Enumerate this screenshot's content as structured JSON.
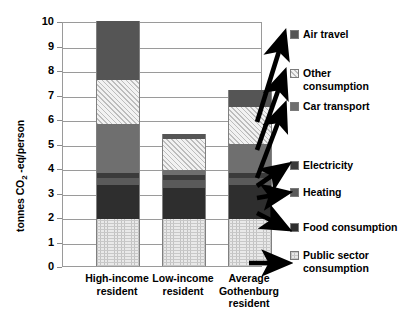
{
  "chart_data": {
    "type": "bar",
    "subtype": "stacked",
    "title": "",
    "xlabel": "",
    "ylabel": "tonnes CO₂ -eq/person",
    "ylim": [
      0,
      10
    ],
    "yticks": [
      0,
      1,
      2,
      3,
      4,
      5,
      6,
      7,
      8,
      9,
      10
    ],
    "ytick_labels": [
      "0",
      "1",
      "2",
      "3",
      "4",
      "5",
      "6",
      "7",
      "8",
      "9",
      "10"
    ],
    "grid": true,
    "grid_axis": "y",
    "legend_position": "right",
    "categories": [
      "High-income resident",
      "Low-income resident",
      "Average Gothenburg resident"
    ],
    "category_lines": [
      [
        "High-income",
        "resident"
      ],
      [
        "Low-income",
        "resident"
      ],
      [
        "Average",
        "Gothenburg",
        "resident"
      ]
    ],
    "series": [
      {
        "name": "Public sector consumption",
        "key": "public",
        "color": "#e9e9e9",
        "pattern": "dotted-grid",
        "values": [
          1.9,
          1.9,
          1.9
        ]
      },
      {
        "name": "Food consumption",
        "key": "food",
        "color": "#2e2e2e",
        "pattern": "solid",
        "values": [
          1.4,
          1.3,
          1.4
        ]
      },
      {
        "name": "Heating",
        "key": "heat",
        "color": "#5a5a5a",
        "pattern": "solid",
        "values": [
          0.3,
          0.3,
          0.3
        ]
      },
      {
        "name": "Electricity",
        "key": "elec",
        "color": "#3b3b3b",
        "pattern": "solid",
        "values": [
          0.2,
          0.2,
          0.2
        ]
      },
      {
        "name": "Car transport",
        "key": "car",
        "color": "#6f6f6f",
        "pattern": "solid",
        "values": [
          2.0,
          0.2,
          1.2
        ]
      },
      {
        "name": "Other consumption",
        "key": "other",
        "color": "#eeeeee",
        "pattern": "diagonal-hatch",
        "values": [
          1.8,
          1.3,
          1.5
        ]
      },
      {
        "name": "Air travel",
        "key": "air",
        "color": "#555555",
        "pattern": "solid",
        "values": [
          2.4,
          0.2,
          0.7
        ]
      }
    ],
    "totals": [
      10.0,
      5.4,
      7.2
    ],
    "stack_order_bottom_to_top": [
      "public",
      "food",
      "heat",
      "elec",
      "car",
      "other",
      "air"
    ]
  },
  "legend": {
    "items": [
      {
        "label": "Air travel",
        "swatch": "air"
      },
      {
        "label": "Other\nconsumption",
        "swatch": "other"
      },
      {
        "label": "Car transport",
        "swatch": "car"
      },
      {
        "label": "Electricity",
        "swatch": "elec"
      },
      {
        "label": "Heating",
        "swatch": "heat"
      },
      {
        "label": "Food consumption",
        "swatch": "food"
      },
      {
        "label": "Public sector\nconsumption",
        "swatch": "public"
      }
    ]
  },
  "colors": {
    "air": "#555555",
    "other": "#eeeeee",
    "car": "#6f6f6f",
    "elec": "#3b3b3b",
    "heat": "#5a5a5a",
    "food": "#2e2e2e",
    "public": "#e9e9e9",
    "axis": "#9a9a9a",
    "text": "#000000",
    "background": "#ffffff"
  }
}
